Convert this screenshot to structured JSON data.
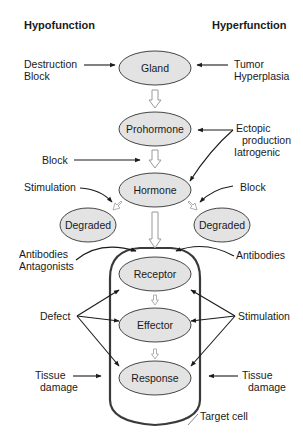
{
  "headers": {
    "left": "Hypofunction",
    "right": "Hyperfunction"
  },
  "nodes": {
    "gland": "Gland",
    "prohormone": "Prohormone",
    "hormone": "Hormone",
    "degraded_left": "Degraded",
    "degraded_right": "Degraded",
    "receptor": "Receptor",
    "effector": "Effector",
    "response": "Response"
  },
  "labels": {
    "destruction": "Destruction",
    "block_gland": "Block",
    "tumor": "Tumor",
    "hyperplasia": "Hyperplasia",
    "ectopic": "Ectopic",
    "production": "production",
    "iatrogenic": "Iatrogenic",
    "block_prohormone": "Block",
    "stimulation_left": "Stimulation",
    "block_right": "Block",
    "antibodies_left": "Antibodies",
    "antagonists": "Antagonists",
    "antibodies_right": "Antibodies",
    "defect": "Defect",
    "stimulation_right": "Stimulation",
    "tissue_left": "Tissue",
    "damage_left": "damage",
    "tissue_right": "Tissue",
    "damage_right": "damage",
    "target_cell": "Target cell"
  },
  "colors": {
    "node_fill": "#e3e3e3",
    "stroke": "#1a1a1a",
    "hollow_arrow": "#9a9a9a"
  }
}
